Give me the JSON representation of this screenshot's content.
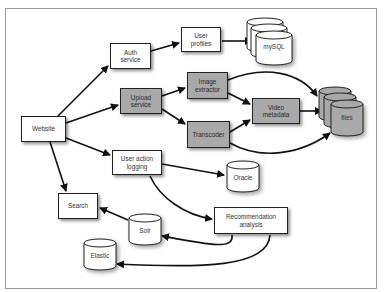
{
  "diagram": {
    "title": "",
    "nodes": {
      "website": {
        "label": "Website",
        "shape": "box",
        "fill": "white"
      },
      "auth_service": {
        "label": "Auth\nservice",
        "shape": "box",
        "fill": "white"
      },
      "user_profiles": {
        "label": "User\nprofiles",
        "shape": "box",
        "fill": "white"
      },
      "mysql": {
        "label": "mySQL",
        "shape": "database-stack",
        "fill": "white"
      },
      "upload_service": {
        "label": "Upload\nservice",
        "shape": "box",
        "fill": "gray"
      },
      "image_extractor": {
        "label": "Image\nextractor",
        "shape": "box",
        "fill": "gray"
      },
      "video_metadata": {
        "label": "Video\nmetadata",
        "shape": "box",
        "fill": "gray"
      },
      "transcoder": {
        "label": "Transcoder",
        "shape": "box",
        "fill": "gray"
      },
      "files": {
        "label": "files",
        "shape": "database-stack",
        "fill": "gray"
      },
      "user_action_logging": {
        "label": "User action\nlogging",
        "shape": "box",
        "fill": "white"
      },
      "oracle": {
        "label": "Oracle",
        "shape": "database",
        "fill": "white"
      },
      "search": {
        "label": "Search",
        "shape": "box",
        "fill": "white"
      },
      "solr": {
        "label": "Solr",
        "shape": "database",
        "fill": "white"
      },
      "elastic": {
        "label": "Elastic",
        "shape": "database",
        "fill": "white"
      },
      "recommendation_analysis": {
        "label": "Recommendation\nanalysis",
        "shape": "box",
        "fill": "white"
      }
    },
    "edges": [
      {
        "from": "Website",
        "to": "Auth service"
      },
      {
        "from": "Website",
        "to": "Upload service"
      },
      {
        "from": "Website",
        "to": "User action logging"
      },
      {
        "from": "Website",
        "to": "Search"
      },
      {
        "from": "Auth service",
        "to": "User profiles"
      },
      {
        "from": "User profiles",
        "to": "mySQL"
      },
      {
        "from": "Upload service",
        "to": "Image extractor"
      },
      {
        "from": "Upload service",
        "to": "Transcoder"
      },
      {
        "from": "Image extractor",
        "to": "files"
      },
      {
        "from": "Image extractor",
        "to": "Video metadata"
      },
      {
        "from": "Transcoder",
        "to": "Video metadata"
      },
      {
        "from": "Transcoder",
        "to": "files"
      },
      {
        "from": "Video metadata",
        "to": "files"
      },
      {
        "from": "User action logging",
        "to": "Oracle"
      },
      {
        "from": "User action logging",
        "to": "Recommendation analysis"
      },
      {
        "from": "Recommendation analysis",
        "to": "Solr"
      },
      {
        "from": "Recommendation analysis",
        "to": "Elastic"
      },
      {
        "from": "Solr",
        "to": "Search"
      }
    ],
    "colors": {
      "gray_fill": "#a9a9a9",
      "white_fill": "#ffffff",
      "stroke": "#111111",
      "frame": "#9a9a9a"
    }
  }
}
